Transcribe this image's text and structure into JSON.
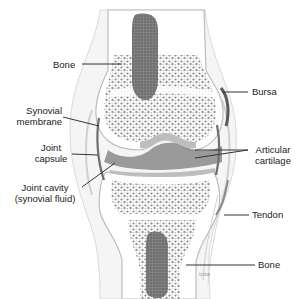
{
  "diagram": {
    "colors": {
      "background": "#ffffff",
      "bone_marrow": "#6f6f6f",
      "spongy_bone": "#8a8a8a",
      "cartilage": "#bdbdbd",
      "capsule": "#d4d4d4",
      "joint_cavity": "#7d7d7d",
      "leader_line": "#333333",
      "label_text": "#222222"
    },
    "labels": [
      {
        "id": "bone-top",
        "text": "Bone"
      },
      {
        "id": "synovial-membrane",
        "line1": "Synovial",
        "line2": "membrane"
      },
      {
        "id": "joint-capsule",
        "line1": "Joint",
        "line2": "capsule"
      },
      {
        "id": "joint-cavity",
        "line1": "Joint cavity",
        "line2": "(synovial fluid)"
      },
      {
        "id": "bursa",
        "text": "Bursa"
      },
      {
        "id": "articular-cartilage",
        "line1": "Articular",
        "line2": "cartilage"
      },
      {
        "id": "tendon",
        "text": "Tendon"
      },
      {
        "id": "bone-bottom",
        "text": "Bone"
      }
    ],
    "signature": "tcsa"
  }
}
